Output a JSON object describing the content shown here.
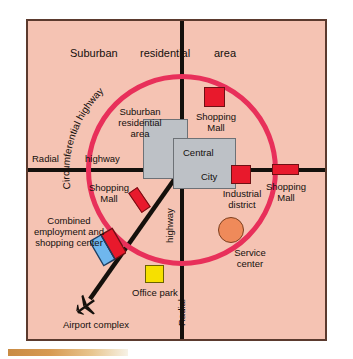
{
  "diagram": {
    "background_color": "#f5c3b3",
    "frame_color": "#5b3a2e",
    "ring_color": "#e8305a",
    "road_color": "#14100c"
  },
  "labels": {
    "suburban_top_1": "Suburban",
    "suburban_top_2": "residential",
    "suburban_top_3": "area",
    "circumferential_highway": "Circumferential highway",
    "suburban_inner_1": "Suburban",
    "suburban_inner_2": "residential",
    "suburban_inner_3": "area",
    "radial": "Radial",
    "highway_h": "highway",
    "highway_v": "highway",
    "radial_v": "Radial",
    "central": "Central",
    "city": "City",
    "shopping_mall_top_1": "Shopping",
    "shopping_mall_top_2": "Mall",
    "shopping_mall_left_1": "Shopping",
    "shopping_mall_left_2": "Mall",
    "shopping_mall_right_1": "Shopping",
    "shopping_mall_right_2": "Mall",
    "industrial_district_1": "Industrial",
    "industrial_district_2": "district",
    "service_center_1": "Service",
    "service_center_2": "center",
    "combined_center_1": "Combined",
    "combined_center_2": "employment and",
    "combined_center_3": "shopping center",
    "office_park": "Office park",
    "airport_complex": "Airport complex"
  },
  "features": [
    {
      "name": "shopping-mall-top",
      "kind": "square",
      "color": "#e8192c"
    },
    {
      "name": "shopping-mall-left",
      "kind": "rotated-rect",
      "color": "#e8192c"
    },
    {
      "name": "shopping-mall-right",
      "kind": "wide-rect",
      "color": "#e8192c"
    },
    {
      "name": "industrial-district",
      "kind": "square",
      "color": "#e8192c"
    },
    {
      "name": "service-center",
      "kind": "circle",
      "color": "#ef8a5a"
    },
    {
      "name": "office-park",
      "kind": "square",
      "color": "#f6e000"
    },
    {
      "name": "combined-center",
      "kind": "split-square",
      "color": "#e8192c",
      "color2": "#6fb7ee"
    },
    {
      "name": "central-city-block-a",
      "kind": "rect",
      "color": "#bdc1c6"
    },
    {
      "name": "central-city-block-b",
      "kind": "rect",
      "color": "#bdc1c6"
    },
    {
      "name": "airport-complex",
      "kind": "airplane-icon",
      "color": "#14100c"
    }
  ]
}
